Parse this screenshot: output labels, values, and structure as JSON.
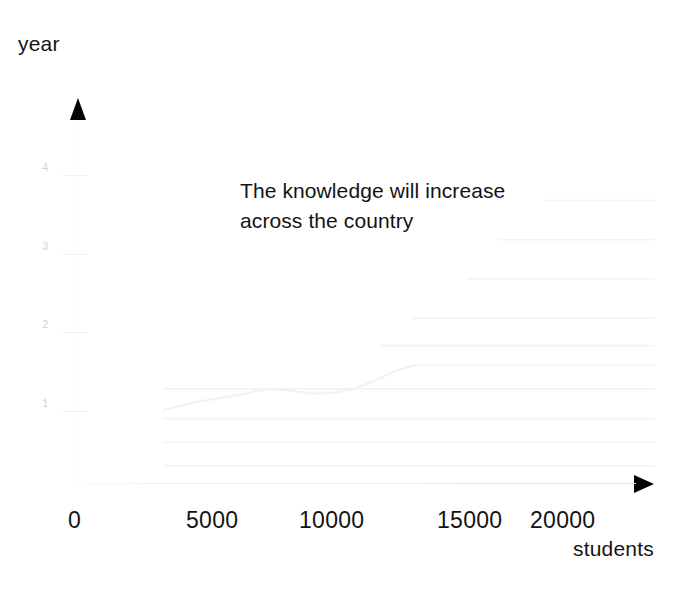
{
  "chart_data": {
    "type": "line",
    "title": "",
    "annotation": "The knowledge will  increase\nacross the country",
    "xlabel": "students",
    "ylabel": "year",
    "xlim": [
      0,
      23000
    ],
    "ylim": [
      0,
      4.6
    ],
    "grid": true,
    "legend": "none",
    "x_ticks": [
      {
        "label": "0",
        "value": 0
      },
      {
        "label": "5000",
        "value": 5000
      },
      {
        "label": "10000",
        "value": 10000
      },
      {
        "label": "15000",
        "value": 15000
      },
      {
        "label": "20000",
        "value": 20000
      }
    ],
    "y_ticks": [
      {
        "label": "1",
        "value": 1
      },
      {
        "label": "2",
        "value": 2
      },
      {
        "label": "3",
        "value": 3
      },
      {
        "label": "4",
        "value": 4
      }
    ],
    "series": [
      {
        "name": "knowledge-growth",
        "color": "#f2f2f4",
        "x": [
          3400,
          4500,
          5600,
          6700,
          7500,
          8400,
          9300,
          10200,
          11000,
          11800,
          12600,
          13400
        ],
        "values": [
          0.93,
          1.02,
          1.08,
          1.14,
          1.2,
          1.18,
          1.14,
          1.15,
          1.2,
          1.3,
          1.42,
          1.5
        ]
      }
    ],
    "step_segments": [
      {
        "y": 3.6,
        "x_start": 18600,
        "x_end": 23000
      },
      {
        "y": 3.1,
        "x_start": 16800,
        "x_end": 23000
      },
      {
        "y": 2.6,
        "x_start": 15500,
        "x_end": 23000
      },
      {
        "y": 2.1,
        "x_start": 13300,
        "x_end": 23000
      },
      {
        "y": 1.75,
        "x_start": 12000,
        "x_end": 23000
      },
      {
        "y": 1.5,
        "x_start": 13400,
        "x_end": 23000
      },
      {
        "y": 1.2,
        "x_start": 3400,
        "x_end": 23000
      },
      {
        "y": 0.82,
        "x_start": 3400,
        "x_end": 23000
      },
      {
        "y": 0.52,
        "x_start": 3400,
        "x_end": 23000
      },
      {
        "y": 0.22,
        "x_start": 3400,
        "x_end": 23000
      }
    ],
    "colors": {
      "text": "#131313",
      "axis": "#ececec",
      "grid": "#f3f3f5",
      "line": "#f2f2f4",
      "arrow": "#050505"
    }
  }
}
